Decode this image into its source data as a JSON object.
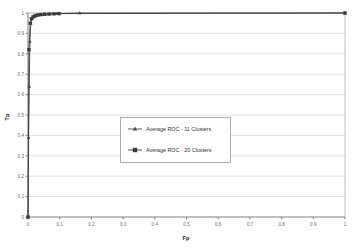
{
  "chart_data": {
    "type": "line",
    "title": "",
    "xlabel": "Fp",
    "ylabel": "Tp",
    "xlim": [
      0,
      1
    ],
    "ylim": [
      0,
      1
    ],
    "grid": true,
    "grid_axis": "y",
    "legend_position": "center",
    "xticks": [
      "0",
      "0.1",
      "0.2",
      "0.3",
      "0.4",
      "0.5",
      "0.6",
      "0.7",
      "0.8",
      "0.9",
      "1"
    ],
    "yticks": [
      "0",
      "0.1",
      "0.2",
      "0.3",
      "0.4",
      "0.5",
      "0.6",
      "0.7",
      "0.8",
      "0.9",
      "1"
    ],
    "xtick_values": [
      0,
      0.1,
      0.2,
      0.3,
      0.4,
      0.5,
      0.6,
      0.7,
      0.8,
      0.9,
      1
    ],
    "ytick_values": [
      0,
      0.1,
      0.2,
      0.3,
      0.4,
      0.5,
      0.6,
      0.7,
      0.8,
      0.9,
      1
    ],
    "series": [
      {
        "name": "Average ROC - 11 Clusters",
        "marker": "triangle",
        "color": "#4a4a4a",
        "x": [
          0,
          0.002,
          0.004,
          0.006,
          0.009,
          0.013,
          0.018,
          0.024,
          0.032,
          0.042,
          0.055,
          0.07,
          0.09,
          0.163,
          1
        ],
        "y": [
          0,
          0.39,
          0.64,
          0.86,
          0.95,
          0.975,
          0.982,
          0.986,
          0.99,
          0.992,
          0.994,
          0.995,
          0.997,
          1,
          1
        ]
      },
      {
        "name": "Average ROC - 20 Clusters",
        "marker": "square",
        "color": "#3c3c3c",
        "x": [
          0,
          0.003,
          0.007,
          0.011,
          0.016,
          0.022,
          0.03,
          0.04,
          0.052,
          0.066,
          0.082,
          0.098,
          1
        ],
        "y": [
          0,
          0.82,
          0.95,
          0.972,
          0.981,
          0.986,
          0.99,
          0.992,
          0.994,
          0.995,
          0.996,
          0.997,
          1
        ]
      }
    ],
    "colors": {
      "grid": "#d9d9d9",
      "axis": "#808080",
      "plot_background": "#ffffff",
      "legend_border": "#9a9a9a",
      "text": "#6b6b6b"
    }
  },
  "legend": {
    "entries": [
      {
        "label": "Average ROC - 11 Clusters"
      },
      {
        "label": "Average ROC - 20 Clusters"
      }
    ]
  }
}
